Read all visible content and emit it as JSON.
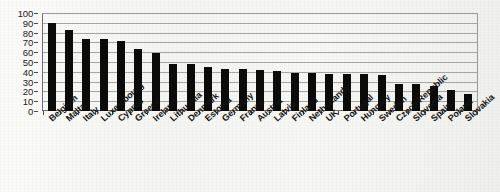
{
  "chart_data": {
    "type": "bar",
    "title": "",
    "xlabel": "",
    "ylabel": "",
    "ylim": [
      0,
      100
    ],
    "ytick_step": 10,
    "yticks": [
      0,
      10,
      20,
      30,
      40,
      50,
      60,
      70,
      80,
      90,
      100
    ],
    "grid": true,
    "legend": "none",
    "bar_color": "#0b0b0b",
    "background_color": "#f5f5f3",
    "gridline_color": "#a5a5a5",
    "axis_color": "#6e6e6e",
    "categories": [
      "Belgium",
      "Malta",
      "Italy",
      "Luxembourg",
      "Cyprus",
      "Greece",
      "Ireland",
      "Lithuania",
      "Denmark",
      "Estonia",
      "Germany",
      "France",
      "Austria",
      "Latvia",
      "Finland",
      "Netherlands",
      "UK",
      "Portugal",
      "Hungary",
      "Sweden",
      "Czech Republic",
      "Slovenia",
      "Spain",
      "Poland",
      "Slovakia"
    ],
    "values": [
      90,
      83,
      73,
      73,
      71,
      63,
      59,
      48,
      48,
      45,
      43,
      43,
      42,
      41,
      39,
      39,
      38,
      38,
      38,
      37,
      28,
      28,
      26,
      21,
      17
    ]
  }
}
